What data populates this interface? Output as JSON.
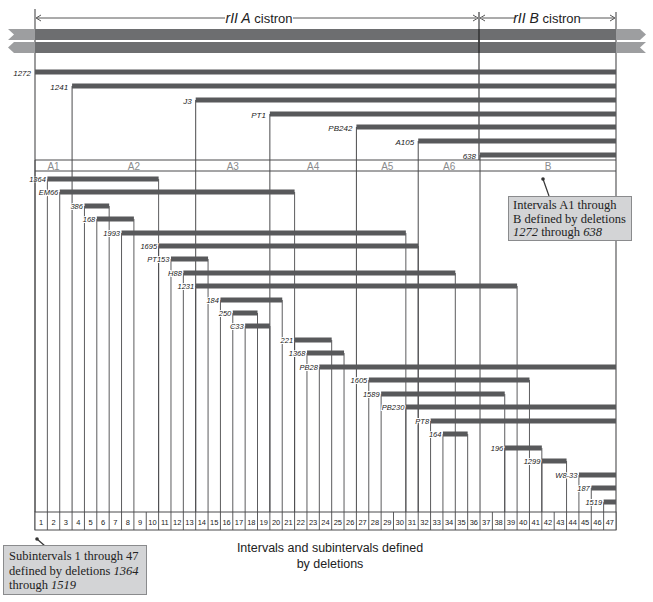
{
  "title": {
    "cistron_a": {
      "italic": "rII A",
      "plain": " cistron"
    },
    "cistron_b": {
      "italic": "rII B",
      "plain": " cistron"
    }
  },
  "layout": {
    "x_left": 35,
    "x_right": 616,
    "x_divider": 479,
    "num_subintervals": 47,
    "subinterval_top": 512,
    "subinterval_bottom": 530
  },
  "colors": {
    "bar": "#58595b",
    "dna": "#6d6e70",
    "dna_tip": "#9d9ea0",
    "line": "#4a4a4c",
    "interval_label": "#8a8b8d",
    "callout_bg": "#d3d4d6"
  },
  "intervals": [
    {
      "name": "A1",
      "start_sub": 1,
      "end_sub": 3
    },
    {
      "name": "A2",
      "start_sub": 4,
      "end_sub": 13
    },
    {
      "name": "A3",
      "start_sub": 14,
      "end_sub": 19
    },
    {
      "name": "A4",
      "start_sub": 20,
      "end_sub": 26
    },
    {
      "name": "A5",
      "start_sub": 27,
      "end_sub": 31
    },
    {
      "name": "A6",
      "start_sub": 32,
      "end_sub": 36
    },
    {
      "name": "B",
      "start_sub": 37,
      "end_sub": 47
    }
  ],
  "interval_band": {
    "top": 160,
    "bottom": 171
  },
  "major_deletions": [
    {
      "label": "1272",
      "y": 72,
      "start_sub": 1
    },
    {
      "label": "1241",
      "y": 86,
      "start_sub": 4
    },
    {
      "label": "J3",
      "y": 100,
      "start_sub": 14
    },
    {
      "label": "PT1",
      "y": 114,
      "start_sub": 20
    },
    {
      "label": "PB242",
      "y": 127,
      "start_sub": 27
    },
    {
      "label": "A105",
      "y": 141,
      "start_sub": 32
    },
    {
      "label": "638",
      "y": 155,
      "start_sub": 37
    }
  ],
  "sub_deletions": [
    {
      "label": "1364",
      "y": 179,
      "start_sub": 2,
      "end_sub": 10
    },
    {
      "label": "EM66",
      "y": 192,
      "start_sub": 3,
      "end_sub": 21
    },
    {
      "label": "386",
      "y": 206,
      "start_sub": 5,
      "end_sub": 6
    },
    {
      "label": "168",
      "y": 219,
      "start_sub": 6,
      "end_sub": 8
    },
    {
      "label": "1993",
      "y": 233,
      "start_sub": 8,
      "end_sub": 30
    },
    {
      "label": "1695",
      "y": 246,
      "start_sub": 11,
      "end_sub": 31
    },
    {
      "label": "PT153",
      "y": 259,
      "start_sub": 12,
      "end_sub": 14
    },
    {
      "label": "H88",
      "y": 273,
      "start_sub": 13,
      "end_sub": 34
    },
    {
      "label": "1231",
      "y": 286,
      "start_sub": 14,
      "end_sub": 39
    },
    {
      "label": "184",
      "y": 300,
      "start_sub": 16,
      "end_sub": 20
    },
    {
      "label": "250",
      "y": 313,
      "start_sub": 17,
      "end_sub": 18
    },
    {
      "label": "C33",
      "y": 326,
      "start_sub": 18,
      "end_sub": 19
    },
    {
      "label": "221",
      "y": 340,
      "start_sub": 22,
      "end_sub": 24
    },
    {
      "label": "1368",
      "y": 353,
      "start_sub": 23,
      "end_sub": 25
    },
    {
      "label": "PB28",
      "y": 367,
      "start_sub": 24,
      "end_sub": 47
    },
    {
      "label": "1605",
      "y": 380,
      "start_sub": 28,
      "end_sub": 40
    },
    {
      "label": "1589",
      "y": 394,
      "start_sub": 29,
      "end_sub": 38
    },
    {
      "label": "PB230",
      "y": 407,
      "start_sub": 31,
      "end_sub": 47
    },
    {
      "label": "PT8",
      "y": 421,
      "start_sub": 33,
      "end_sub": 47
    },
    {
      "label": "164",
      "y": 434,
      "start_sub": 34,
      "end_sub": 35
    },
    {
      "label": "196",
      "y": 448,
      "start_sub": 39,
      "end_sub": 41
    },
    {
      "label": "1299",
      "y": 461,
      "start_sub": 42,
      "end_sub": 43
    },
    {
      "label": "W8-33",
      "y": 475,
      "start_sub": 45,
      "end_sub": 47
    },
    {
      "label": "187",
      "y": 488,
      "start_sub": 46,
      "end_sub": 47
    },
    {
      "label": "1519",
      "y": 502,
      "start_sub": 47,
      "end_sub": 47
    }
  ],
  "subintervals": [
    "1",
    "2",
    "3",
    "4",
    "5",
    "6",
    "7",
    "8",
    "9",
    "10",
    "11",
    "12",
    "13",
    "14",
    "15",
    "16",
    "17",
    "18",
    "19",
    "20",
    "21",
    "22",
    "23",
    "24",
    "25",
    "26",
    "27",
    "28",
    "29",
    "30",
    "31",
    "32",
    "33",
    "34",
    "35",
    "36",
    "37",
    "38",
    "39",
    "40",
    "41",
    "42",
    "43",
    "44",
    "45",
    "46",
    "47"
  ],
  "callouts": {
    "intervals": {
      "line1": "Intervals A1 through",
      "line2": "B defined by deletions",
      "line3_a": "1272",
      "line3_b": " through ",
      "line3_c": "638"
    },
    "subintervals": {
      "line1": "Subintervals 1 through 47",
      "line2_a": "defined by deletions ",
      "line2_b": "1364",
      "line3_a": "through ",
      "line3_b": "1519"
    }
  },
  "caption": {
    "line1": "Intervals and subintervals defined",
    "line2": "by deletions"
  }
}
